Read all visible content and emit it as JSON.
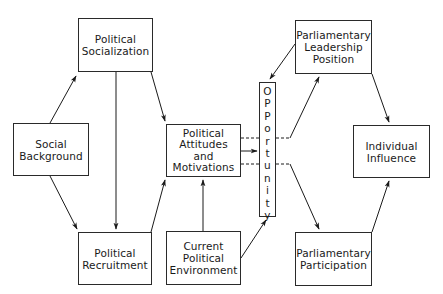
{
  "diagram": {
    "type": "flow-model",
    "nodes": {
      "political_socialization": {
        "label": "Political\nSocialization"
      },
      "social_background": {
        "label": "Social\nBackground"
      },
      "political_recruitment": {
        "label": "Political\nRecruitment"
      },
      "political_attitudes": {
        "label": "Political\nAttitudes\nand\nMotivations"
      },
      "current_environment": {
        "label": "Current\nPolitical\nEnvironment"
      },
      "opportunity": {
        "label": "O\nP\nP\no\nr\nt\nu\nn\ni\nt\ny"
      },
      "leadership_position": {
        "label": "Parliamentary\nLeadership\nPosition"
      },
      "participation": {
        "label": "Parliamentary\nParticipation"
      },
      "individual_influence": {
        "label": "Individual\nInfluence"
      }
    },
    "edges": [
      {
        "from": "Social Background",
        "to": "Political Socialization",
        "style": "solid"
      },
      {
        "from": "Social Background",
        "to": "Political Recruitment",
        "style": "solid"
      },
      {
        "from": "Political Socialization",
        "to": "Political Recruitment",
        "style": "solid"
      },
      {
        "from": "Political Socialization",
        "to": "Political Attitudes and Motivations",
        "style": "solid"
      },
      {
        "from": "Political Recruitment",
        "to": "Political Attitudes and Motivations",
        "style": "solid"
      },
      {
        "from": "Current Political Environment",
        "to": "Political Attitudes and Motivations",
        "style": "solid"
      },
      {
        "from": "Current Political Environment",
        "to": "Opportunity",
        "style": "solid"
      },
      {
        "from": "Political Attitudes and Motivations",
        "to": "Opportunity",
        "style": "solid"
      },
      {
        "from": "Parliamentary Leadership Position",
        "to": "Opportunity",
        "style": "solid"
      },
      {
        "from": "Political Attitudes and Motivations",
        "to": "Parliamentary Leadership Position",
        "style": "dashed-through-opportunity"
      },
      {
        "from": "Political Attitudes and Motivations",
        "to": "Parliamentary Participation",
        "style": "dashed-through-opportunity"
      },
      {
        "from": "Parliamentary Leadership Position",
        "to": "Individual Influence",
        "style": "solid"
      },
      {
        "from": "Parliamentary Participation",
        "to": "Individual Influence",
        "style": "solid"
      }
    ],
    "colors": {
      "line": "#1a1a1a",
      "background": "#ffffff"
    }
  }
}
